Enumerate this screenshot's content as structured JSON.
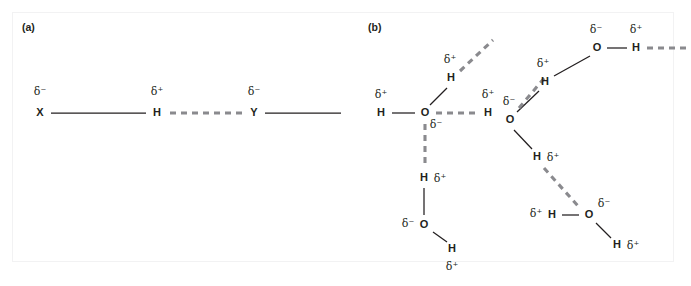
{
  "figure": {
    "background_color": "#ffffff",
    "border_color": "#f2f2f3",
    "atom_color": "#231f20",
    "covalent_bond_color": "#231f20",
    "hydrogen_bond_color": "#8a8a8e"
  },
  "chart_data": {
    "type": "diagram",
    "subtitle": "",
    "xlabel": "",
    "ylabel": "",
    "legend": [],
    "panels": [
      {
        "key": "a",
        "label": "(a)",
        "description": "Generic hydrogen bond X-H...Y",
        "atoms": [
          {
            "id": "a-X",
            "symbol": "X",
            "charge": "δ⁻",
            "x": 40,
            "y": 113,
            "charge_x": 40,
            "charge_y": 92
          },
          {
            "id": "a-H",
            "symbol": "H",
            "charge": "δ⁺",
            "x": 157,
            "y": 113,
            "charge_x": 157,
            "charge_y": 92
          },
          {
            "id": "a-Y",
            "symbol": "Y",
            "charge": "δ⁻",
            "x": 254,
            "y": 113,
            "charge_x": 254,
            "charge_y": 92
          }
        ],
        "covalent_bonds": [
          {
            "id": "a-bond-X-H",
            "x1": 51,
            "y1": 113,
            "x2": 146,
            "y2": 113
          },
          {
            "id": "a-bond-Y-R",
            "x1": 265,
            "y1": 113,
            "x2": 341,
            "y2": 113
          }
        ],
        "hydrogen_bonds": [
          {
            "id": "a-hbond-H-Y",
            "x1": 170,
            "y1": 113,
            "x2": 243,
            "y2": 113
          }
        ]
      },
      {
        "key": "b",
        "label": "(b)",
        "description": "Hydrogen-bonded network of water molecules",
        "atoms": [
          {
            "id": "b-O1",
            "symbol": "O",
            "charge": "δ⁻",
            "x": 425,
            "y": 113,
            "charge_x": 436,
            "charge_y": 125
          },
          {
            "id": "b-H1a",
            "symbol": "H",
            "charge": "δ⁺",
            "x": 381,
            "y": 113,
            "charge_x": 381,
            "charge_y": 95
          },
          {
            "id": "b-H1b",
            "symbol": "H",
            "charge": "δ⁺",
            "x": 451,
            "y": 78,
            "charge_x": 450,
            "charge_y": 60
          },
          {
            "id": "b-H2",
            "symbol": "H",
            "charge": "δ⁺",
            "x": 488,
            "y": 113,
            "charge_x": 488,
            "charge_y": 95
          },
          {
            "id": "b-H3",
            "symbol": "H",
            "charge": "δ⁺",
            "x": 424,
            "y": 178,
            "charge_x": 440,
            "charge_y": 179
          },
          {
            "id": "b-O2",
            "symbol": "O",
            "charge": "δ⁻",
            "x": 424,
            "y": 225,
            "charge_x": 408,
            "charge_y": 224
          },
          {
            "id": "b-H4",
            "symbol": "H",
            "charge": "δ⁺",
            "x": 452,
            "y": 249,
            "charge_x": 452,
            "charge_y": 267
          },
          {
            "id": "b-O3",
            "symbol": "O",
            "charge": "δ⁻",
            "x": 510,
            "y": 120,
            "charge_x": 509,
            "charge_y": 102
          },
          {
            "id": "b-H5",
            "symbol": "H",
            "charge": "δ⁺",
            "x": 545,
            "y": 82,
            "charge_x": 543,
            "charge_y": 64
          },
          {
            "id": "b-O4",
            "symbol": "O",
            "charge": "δ⁻",
            "x": 597,
            "y": 48,
            "charge_x": 596,
            "charge_y": 30
          },
          {
            "id": "b-H6",
            "symbol": "H",
            "charge": "δ⁺",
            "x": 636,
            "y": 48,
            "charge_x": 636,
            "charge_y": 30
          },
          {
            "id": "b-H7",
            "symbol": "H",
            "charge": "δ⁺",
            "x": 537,
            "y": 157,
            "charge_x": 553,
            "charge_y": 158
          },
          {
            "id": "b-O5",
            "symbol": "O",
            "charge": "δ⁻",
            "x": 589,
            "y": 215,
            "charge_x": 604,
            "charge_y": 204
          },
          {
            "id": "b-H8",
            "symbol": "H",
            "charge": "δ⁺",
            "x": 552,
            "y": 215,
            "charge_x": 536,
            "charge_y": 214
          },
          {
            "id": "b-H9",
            "symbol": "H",
            "charge": "δ⁺",
            "x": 617,
            "y": 245,
            "charge_x": 633,
            "charge_y": 246
          }
        ],
        "covalent_bonds": [
          {
            "id": "b-bond-O1-H1a",
            "x1": 392,
            "y1": 113,
            "x2": 415,
            "y2": 113
          },
          {
            "id": "b-bond-O1-H1b",
            "x1": 430,
            "y1": 105,
            "x2": 447,
            "y2": 88
          },
          {
            "id": "b-bond-O2-H3",
            "x1": 424,
            "y1": 215,
            "x2": 424,
            "y2": 188
          },
          {
            "id": "b-bond-O2-H4",
            "x1": 433,
            "y1": 232,
            "x2": 447,
            "y2": 242
          },
          {
            "id": "b-bond-O3-H5",
            "x1": 517,
            "y1": 112,
            "x2": 539,
            "y2": 91
          },
          {
            "id": "b-bond-O3-H7",
            "x1": 514,
            "y1": 130,
            "x2": 532,
            "y2": 149
          },
          {
            "id": "b-bond-O4-H6",
            "x1": 607,
            "y1": 48,
            "x2": 627,
            "y2": 48
          },
          {
            "id": "b-bond-O4-H5",
            "x1": 590,
            "y1": 56,
            "x2": 554,
            "y2": 76
          },
          {
            "id": "b-bond-O5-H8",
            "x1": 579,
            "y1": 215,
            "x2": 562,
            "y2": 215
          },
          {
            "id": "b-bond-O5-H9",
            "x1": 596,
            "y1": 223,
            "x2": 611,
            "y2": 238
          }
        ],
        "hydrogen_bonds": [
          {
            "id": "b-hbond-O1-H2",
            "x1": 436,
            "y1": 113,
            "x2": 479,
            "y2": 113
          },
          {
            "id": "b-hbond-O1-H3",
            "x1": 425,
            "y1": 124,
            "x2": 425,
            "y2": 168
          },
          {
            "id": "b-hbond-H1b-up",
            "x1": 460,
            "y1": 71,
            "x2": 493,
            "y2": 40
          },
          {
            "id": "b-hbond-O3-H5b",
            "x1": 519,
            "y1": 108,
            "x2": 546,
            "y2": 76
          },
          {
            "id": "b-hbond-H7-O5",
            "x1": 544,
            "y1": 168,
            "x2": 578,
            "y2": 206
          },
          {
            "id": "b-hbond-H6-right",
            "x1": 647,
            "y1": 48,
            "x2": 691,
            "y2": 48
          }
        ]
      }
    ]
  },
  "panel_a": {
    "label": "(a)",
    "label_x": 22,
    "label_y": 28
  },
  "panel_b": {
    "label": "(b)",
    "label_x": 368,
    "label_y": 28
  }
}
